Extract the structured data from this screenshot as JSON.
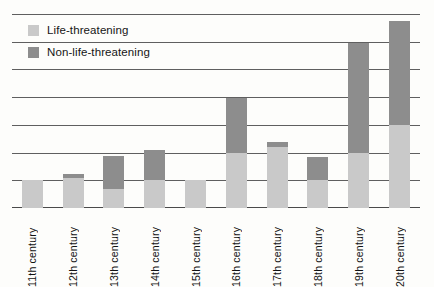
{
  "chart_data": {
    "type": "bar",
    "subtype": "stacked-vertical",
    "title": "",
    "subtitle": "",
    "xlabel": "",
    "ylabel": "",
    "categories": [
      "11th century",
      "12th century",
      "13th century",
      "14th century",
      "15th century",
      "16th century",
      "17th century",
      "18th century",
      "19th century",
      "20th century"
    ],
    "series": [
      {
        "name": "Life-threatening",
        "color": "#c9c9c9",
        "values": [
          1.0,
          1.1,
          0.7,
          1.0,
          1.0,
          2.0,
          2.2,
          1.0,
          2.0,
          3.0
        ]
      },
      {
        "name": "Non-life-threatening",
        "color": "#8d8d8d",
        "values": [
          0.0,
          0.15,
          1.2,
          1.1,
          0.0,
          2.0,
          0.2,
          0.85,
          4.0,
          3.8
        ]
      }
    ],
    "totals": [
      1.0,
      1.25,
      1.9,
      2.1,
      1.0,
      4.0,
      2.4,
      1.85,
      6.0,
      6.8
    ],
    "ylim": [
      0,
      7
    ],
    "ytick_values": [
      0,
      1,
      2,
      3,
      4,
      5,
      6,
      7
    ],
    "ytick_labels": [
      "",
      "",
      "",
      "",
      "",
      "",
      "",
      ""
    ],
    "grid": true,
    "grid_orientation": "horizontal",
    "grid_count": 8,
    "legend_position": "top-left",
    "xtick_rotation": -90,
    "background_color": "#fdfdfb",
    "gridline_color": "#5f5f5f",
    "axis_color": "#4a4a4a"
  },
  "legend": {
    "items": [
      {
        "label": "Life-threatening",
        "swatch": "light"
      },
      {
        "label": "Non-life-threatening",
        "swatch": "dark"
      }
    ]
  }
}
